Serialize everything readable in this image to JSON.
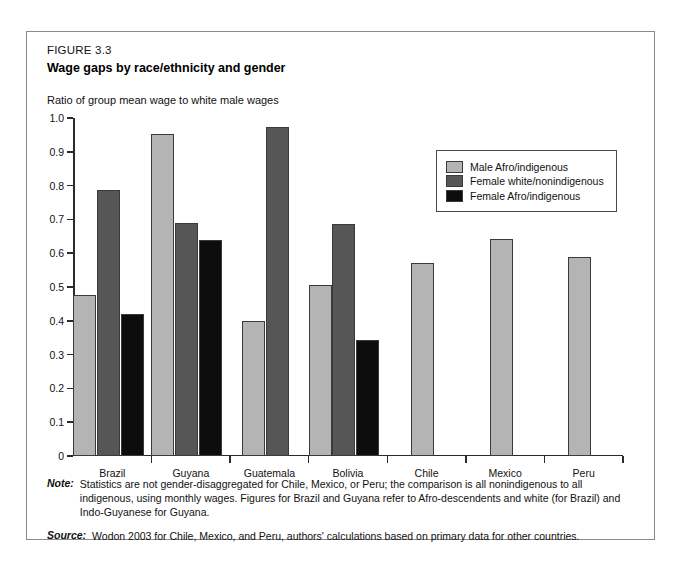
{
  "figure": {
    "number": "FIGURE 3.3",
    "title": "Wage gaps by race/ethnicity and gender"
  },
  "notes": {
    "note_tag": "Note:",
    "note_text": "Statistics are not gender-disaggregated for Chile, Mexico, or Peru; the comparison is all nonindigenous to all indigenous, using monthly wages. Figures for Brazil and Guyana refer to Afro-descendents and white (for Brazil) and Indo-Guyanese for Guyana.",
    "source_tag": "Source:",
    "source_text": "Wodon 2003 for Chile, Mexico, and Peru, authors' calculations based on primary data for other countries."
  },
  "colors": {
    "series0": "#b4b4b4",
    "series1": "#565656",
    "series2": "#0d0d0d",
    "axis": "#2b2b2b",
    "frame": "#8a8a8a"
  },
  "chart_data": {
    "type": "bar",
    "title": "Wage gaps by race/ethnicity and gender",
    "ylabel": "Ratio of group mean wage to white male wages",
    "xlabel": "",
    "ylim": [
      0,
      1.0
    ],
    "yticks": [
      0,
      0.1,
      0.2,
      0.3,
      0.4,
      0.5,
      0.6,
      0.7,
      0.8,
      0.9,
      1.0
    ],
    "ytick_labels": [
      "0",
      "0.1",
      "0.2",
      "0.3",
      "0.4",
      "0.5",
      "0.6",
      "0.7",
      "0.8",
      "0.9",
      "1.0"
    ],
    "grid": false,
    "legend_position": "upper right",
    "categories": [
      "Brazil",
      "Guyana",
      "Guatemala",
      "Bolivia",
      "Chile",
      "Mexico",
      "Peru"
    ],
    "series": [
      {
        "name": "Male Afro/indigenous",
        "color": "#b4b4b4",
        "values": [
          0.475,
          0.952,
          0.399,
          0.505,
          0.572,
          0.643,
          0.588
        ]
      },
      {
        "name": "Female white/nonindigenous",
        "color": "#565656",
        "values": [
          0.787,
          0.689,
          0.973,
          0.686,
          null,
          null,
          null
        ]
      },
      {
        "name": "Female Afro/indigenous",
        "color": "#0d0d0d",
        "values": [
          0.42,
          0.638,
          null,
          0.343,
          null,
          null,
          null
        ]
      }
    ]
  }
}
